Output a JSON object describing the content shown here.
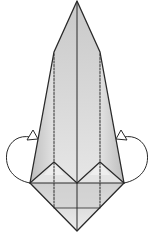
{
  "diagram": {
    "type": "origami-fold-step",
    "colors": {
      "paper_light": "#f2f2f2",
      "paper_mid": "#d6d6d6",
      "paper_dark": "#b9b9b9",
      "line": "#2a2a2a",
      "background": "#ffffff"
    },
    "annotations": [
      {
        "id": "left-fold-behind-arrow",
        "kind": "mountain-fold arrow (loop behind)",
        "side": "left"
      },
      {
        "id": "right-fold-behind-arrow",
        "kind": "mountain-fold arrow (loop behind)",
        "side": "right"
      }
    ],
    "crease_lines": [
      {
        "id": "center-crease",
        "style": "solid"
      },
      {
        "id": "left-vertical-crease",
        "style": "dashed"
      },
      {
        "id": "right-vertical-crease",
        "style": "dashed"
      }
    ]
  }
}
